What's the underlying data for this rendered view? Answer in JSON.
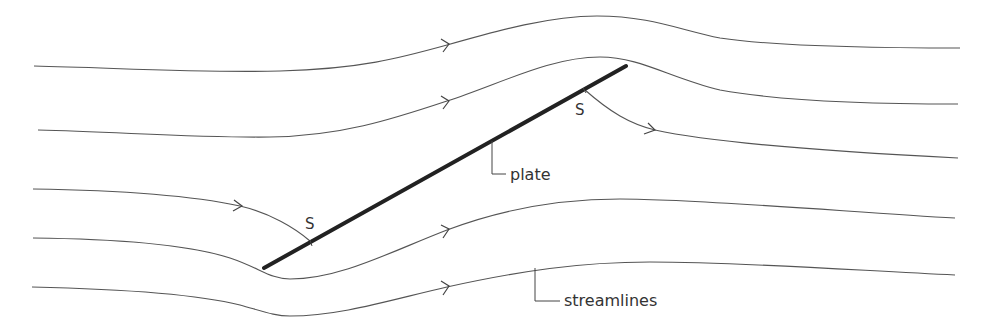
{
  "diagram": {
    "labels": {
      "plate": "plate",
      "streamlines": "streamlines",
      "stagnation_front": "S",
      "stagnation_rear": "S"
    },
    "colors": {
      "background": "#ffffff",
      "streamline": "#555555",
      "plate": "#222222"
    },
    "plate": {
      "x1": 264,
      "y1": 268,
      "x2": 626,
      "y2": 66
    },
    "streamline_count": 5,
    "flow_direction": "left-to-right"
  }
}
